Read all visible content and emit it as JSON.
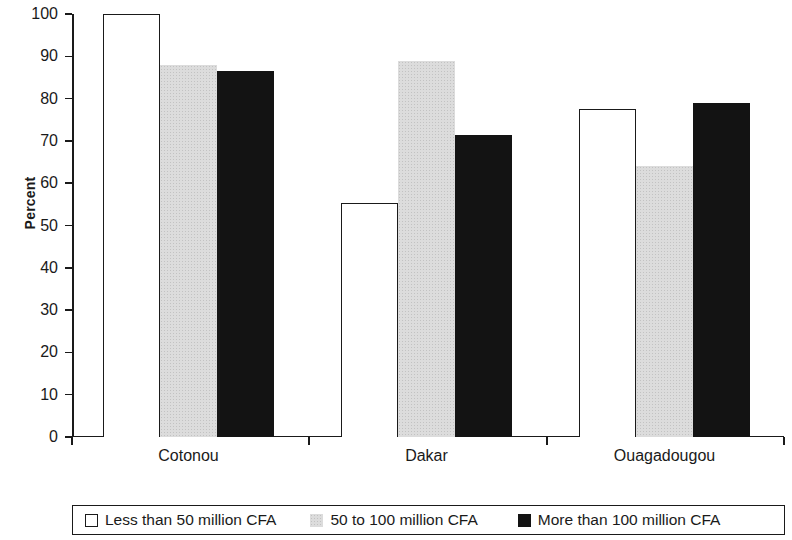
{
  "chart_data": {
    "type": "bar",
    "title": "",
    "xlabel": "",
    "ylabel": "Percent",
    "ylim": [
      0,
      100
    ],
    "ytick_labels": [
      "0",
      "10",
      "20",
      "30",
      "40",
      "50",
      "60",
      "70",
      "80",
      "90",
      "100"
    ],
    "ytick_values": [
      0,
      10,
      20,
      30,
      40,
      50,
      60,
      70,
      80,
      90,
      100
    ],
    "grid": false,
    "legend_position": "bottom",
    "categories": [
      "Cotonou",
      "Dakar",
      "Ouagadougou"
    ],
    "series": [
      {
        "name": "Less than 50 million CFA",
        "swatch": "white-square",
        "color": "#ffffff",
        "values": [
          100,
          55.3,
          77.5
        ]
      },
      {
        "name": "50 to 100 million CFA",
        "swatch": "light-gray-square",
        "color": "#dcdcdc",
        "values": [
          88,
          89,
          64
        ]
      },
      {
        "name": "More than 100 million CFA",
        "swatch": "black-square",
        "color": "#131313",
        "values": [
          86.5,
          71.5,
          79
        ]
      }
    ]
  },
  "legend": {
    "items": [
      {
        "label": "Less than 50 million CFA"
      },
      {
        "label": "50 to 100 million CFA"
      },
      {
        "label": "More than 100 million CFA"
      }
    ]
  }
}
